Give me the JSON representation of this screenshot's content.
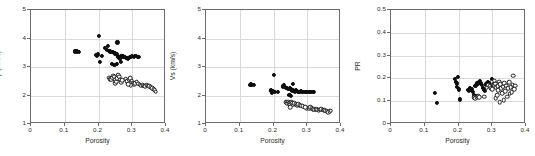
{
  "figure": {
    "background": "#ffffff",
    "grid": true,
    "marker_colors": {
      "filled": "#0d0d0d",
      "open_edge": "#1a1a1a",
      "open_fill": "#ffffff"
    }
  },
  "chart_data": [
    {
      "type": "scatter",
      "title": "",
      "xlabel": "Porosity",
      "ylabel": "Vp (Km/s)",
      "xlim": [
        0,
        0.4
      ],
      "ylim": [
        1,
        5
      ],
      "xticks": [
        0,
        0.1,
        0.2,
        0.3,
        0.4
      ],
      "xticklabels": [
        "0",
        "0.1",
        "0.2",
        "0.3",
        "0.4"
      ],
      "yticks": [
        1,
        2,
        3,
        4,
        5
      ],
      "yticklabels": [
        "1",
        "2",
        "3",
        "4",
        "5"
      ],
      "grid": true,
      "legend": "none",
      "series": [
        {
          "name": "filled-circles",
          "marker": "filled",
          "points": [
            [
              0.129,
              3.55
            ],
            [
              0.133,
              3.56
            ],
            [
              0.137,
              3.55
            ],
            [
              0.141,
              3.54
            ],
            [
              0.193,
              3.42
            ],
            [
              0.196,
              3.4
            ],
            [
              0.199,
              3.44
            ],
            [
              0.2,
              4.1
            ],
            [
              0.203,
              3.17
            ],
            [
              0.21,
              3.38
            ],
            [
              0.22,
              3.68
            ],
            [
              0.226,
              3.6
            ],
            [
              0.229,
              3.74
            ],
            [
              0.232,
              3.57
            ],
            [
              0.234,
              3.55
            ],
            [
              0.238,
              3.53
            ],
            [
              0.24,
              3.1
            ],
            [
              0.243,
              3.52
            ],
            [
              0.246,
              3.5
            ],
            [
              0.249,
              3.48
            ],
            [
              0.252,
              3.46
            ],
            [
              0.254,
              3.44
            ],
            [
              0.256,
              3.86
            ],
            [
              0.258,
              3.36
            ],
            [
              0.26,
              3.34
            ],
            [
              0.262,
              3.33
            ],
            [
              0.264,
              3.3
            ],
            [
              0.266,
              3.18
            ],
            [
              0.268,
              3.4
            ],
            [
              0.271,
              3.38
            ],
            [
              0.274,
              3.36
            ],
            [
              0.277,
              3.34
            ],
            [
              0.28,
              3.33
            ],
            [
              0.283,
              3.31
            ],
            [
              0.286,
              3.3
            ],
            [
              0.289,
              3.32
            ],
            [
              0.292,
              3.36
            ],
            [
              0.296,
              3.34
            ],
            [
              0.3,
              3.38
            ],
            [
              0.304,
              3.36
            ],
            [
              0.308,
              3.4
            ],
            [
              0.312,
              3.38
            ],
            [
              0.316,
              3.36
            ],
            [
              0.318,
              3.34
            ],
            [
              0.255,
              3.12
            ],
            [
              0.247,
              3.08
            ]
          ]
        },
        {
          "name": "open-circles",
          "marker": "open",
          "points": [
            [
              0.231,
              2.62
            ],
            [
              0.234,
              2.58
            ],
            [
              0.237,
              2.55
            ],
            [
              0.24,
              2.62
            ],
            [
              0.243,
              2.7
            ],
            [
              0.246,
              2.66
            ],
            [
              0.249,
              2.56
            ],
            [
              0.249,
              2.44
            ],
            [
              0.252,
              2.48
            ],
            [
              0.255,
              2.6
            ],
            [
              0.258,
              2.72
            ],
            [
              0.261,
              2.66
            ],
            [
              0.264,
              2.56
            ],
            [
              0.267,
              2.46
            ],
            [
              0.271,
              2.54
            ],
            [
              0.281,
              2.58
            ],
            [
              0.285,
              2.5
            ],
            [
              0.29,
              2.56
            ],
            [
              0.294,
              2.6
            ],
            [
              0.298,
              2.52
            ],
            [
              0.301,
              2.44
            ],
            [
              0.305,
              2.4
            ],
            [
              0.309,
              2.44
            ],
            [
              0.313,
              2.48
            ],
            [
              0.318,
              2.42
            ],
            [
              0.322,
              2.38
            ],
            [
              0.327,
              2.34
            ],
            [
              0.331,
              2.36
            ],
            [
              0.335,
              2.34
            ],
            [
              0.339,
              2.33
            ],
            [
              0.343,
              2.36
            ],
            [
              0.347,
              2.34
            ],
            [
              0.351,
              2.32
            ],
            [
              0.355,
              2.3
            ],
            [
              0.359,
              2.26
            ],
            [
              0.363,
              2.22
            ],
            [
              0.366,
              2.18
            ],
            [
              0.369,
              2.14
            ],
            [
              0.296,
              2.36
            ],
            [
              0.288,
              2.4
            ]
          ]
        }
      ]
    },
    {
      "type": "scatter",
      "title": "",
      "xlabel": "Porosity",
      "ylabel": "Vs (km/s)",
      "xlim": [
        0,
        0.4
      ],
      "ylim": [
        1,
        5
      ],
      "xticks": [
        0,
        0.1,
        0.2,
        0.3,
        0.4
      ],
      "xticklabels": [
        "0",
        "0.1",
        "0.2",
        "0.3",
        "0.4"
      ],
      "yticks": [
        1,
        2,
        3,
        4,
        5
      ],
      "yticklabels": [
        "1",
        "2",
        "3",
        "4",
        "5"
      ],
      "grid": true,
      "legend": "none",
      "series": [
        {
          "name": "filled-circles",
          "marker": "filled",
          "points": [
            [
              0.129,
              2.38
            ],
            [
              0.133,
              2.39
            ],
            [
              0.137,
              2.38
            ],
            [
              0.141,
              2.37
            ],
            [
              0.192,
              2.18
            ],
            [
              0.196,
              2.1
            ],
            [
              0.199,
              2.16
            ],
            [
              0.201,
              2.72
            ],
            [
              0.204,
              2.12
            ],
            [
              0.212,
              2.14
            ],
            [
              0.228,
              2.32
            ],
            [
              0.231,
              2.36
            ],
            [
              0.234,
              2.3
            ],
            [
              0.237,
              2.28
            ],
            [
              0.24,
              2.26
            ],
            [
              0.243,
              2.24
            ],
            [
              0.246,
              2.22
            ],
            [
              0.249,
              2.26
            ],
            [
              0.252,
              2.24
            ],
            [
              0.254,
              2.2
            ],
            [
              0.256,
              2.18
            ],
            [
              0.258,
              2.42
            ],
            [
              0.26,
              2.16
            ],
            [
              0.263,
              2.14
            ],
            [
              0.266,
              2.18
            ],
            [
              0.269,
              2.16
            ],
            [
              0.272,
              2.14
            ],
            [
              0.275,
              2.12
            ],
            [
              0.278,
              2.14
            ],
            [
              0.281,
              2.16
            ],
            [
              0.284,
              2.14
            ],
            [
              0.288,
              2.12
            ],
            [
              0.292,
              2.14
            ],
            [
              0.296,
              2.13
            ],
            [
              0.3,
              2.12
            ],
            [
              0.304,
              2.14
            ],
            [
              0.308,
              2.12
            ],
            [
              0.312,
              2.14
            ],
            [
              0.316,
              2.13
            ],
            [
              0.32,
              2.12
            ],
            [
              0.247,
              2.02
            ],
            [
              0.252,
              2.0
            ]
          ]
        },
        {
          "name": "open-circles",
          "marker": "open",
          "points": [
            [
              0.238,
              1.76
            ],
            [
              0.241,
              1.72
            ],
            [
              0.244,
              1.78
            ],
            [
              0.247,
              1.74
            ],
            [
              0.25,
              1.7
            ],
            [
              0.25,
              1.58
            ],
            [
              0.253,
              1.76
            ],
            [
              0.256,
              1.72
            ],
            [
              0.259,
              1.68
            ],
            [
              0.262,
              1.74
            ],
            [
              0.266,
              1.7
            ],
            [
              0.27,
              1.66
            ],
            [
              0.274,
              1.7
            ],
            [
              0.278,
              1.66
            ],
            [
              0.282,
              1.64
            ],
            [
              0.29,
              1.6
            ],
            [
              0.298,
              1.56
            ],
            [
              0.305,
              1.54
            ],
            [
              0.309,
              1.58
            ],
            [
              0.313,
              1.56
            ],
            [
              0.317,
              1.52
            ],
            [
              0.321,
              1.5
            ],
            [
              0.326,
              1.52
            ],
            [
              0.33,
              1.5
            ],
            [
              0.334,
              1.48
            ],
            [
              0.338,
              1.5
            ],
            [
              0.342,
              1.52
            ],
            [
              0.346,
              1.5
            ],
            [
              0.35,
              1.48
            ],
            [
              0.354,
              1.46
            ],
            [
              0.358,
              1.44
            ],
            [
              0.362,
              1.42
            ],
            [
              0.366,
              1.44
            ],
            [
              0.369,
              1.46
            ],
            [
              0.286,
              1.62
            ],
            [
              0.294,
              1.58
            ]
          ]
        }
      ]
    },
    {
      "type": "scatter",
      "title": "",
      "xlabel": "Porosity",
      "ylabel": "PR",
      "xlim": [
        0,
        0.4
      ],
      "ylim": [
        0,
        0.5
      ],
      "xticks": [
        0,
        0.1,
        0.2,
        0.3,
        0.4
      ],
      "xticklabels": [
        "0",
        "0.1",
        "0.2",
        "0.3",
        "0.4"
      ],
      "yticks": [
        0,
        0.1,
        0.2,
        0.3,
        0.4,
        0.5
      ],
      "yticklabels": [
        "0",
        "0.1",
        "0.2",
        "0.3",
        "0.4",
        "0.5"
      ],
      "grid": true,
      "legend": "none",
      "series": [
        {
          "name": "filled-circles",
          "marker": "filled",
          "points": [
            [
              0.131,
              0.138
            ],
            [
              0.137,
              0.094
            ],
            [
              0.19,
              0.197
            ],
            [
              0.193,
              0.186
            ],
            [
              0.196,
              0.178
            ],
            [
              0.196,
              0.162
            ],
            [
              0.199,
              0.205
            ],
            [
              0.202,
              0.152
            ],
            [
              0.205,
              0.108
            ],
            [
              0.228,
              0.148
            ],
            [
              0.231,
              0.144
            ],
            [
              0.234,
              0.158
            ],
            [
              0.238,
              0.152
            ],
            [
              0.242,
              0.14
            ],
            [
              0.246,
              0.128
            ],
            [
              0.25,
              0.166
            ],
            [
              0.252,
              0.172
            ],
            [
              0.255,
              0.18
            ],
            [
              0.258,
              0.176
            ],
            [
              0.261,
              0.184
            ],
            [
              0.264,
              0.188
            ],
            [
              0.267,
              0.178
            ],
            [
              0.27,
              0.17
            ],
            [
              0.273,
              0.16
            ],
            [
              0.276,
              0.152
            ],
            [
              0.279,
              0.146
            ],
            [
              0.282,
              0.174
            ],
            [
              0.285,
              0.182
            ],
            [
              0.288,
              0.186
            ],
            [
              0.291,
              0.178
            ],
            [
              0.294,
              0.17
            ],
            [
              0.297,
              0.162
            ],
            [
              0.3,
              0.196
            ],
            [
              0.304,
              0.178
            ],
            [
              0.252,
              0.122
            ],
            [
              0.245,
              0.116
            ]
          ]
        },
        {
          "name": "open-circles",
          "marker": "open",
          "points": [
            [
              0.246,
              0.118
            ],
            [
              0.25,
              0.112
            ],
            [
              0.254,
              0.116
            ],
            [
              0.258,
              0.122
            ],
            [
              0.262,
              0.118
            ],
            [
              0.288,
              0.17
            ],
            [
              0.292,
              0.166
            ],
            [
              0.296,
              0.158
            ],
            [
              0.3,
              0.152
            ],
            [
              0.304,
              0.172
            ],
            [
              0.308,
              0.176
            ],
            [
              0.31,
              0.112
            ],
            [
              0.312,
              0.16
            ],
            [
              0.314,
              0.126
            ],
            [
              0.316,
              0.166
            ],
            [
              0.318,
              0.148
            ],
            [
              0.32,
              0.186
            ],
            [
              0.322,
              0.096
            ],
            [
              0.324,
              0.174
            ],
            [
              0.327,
              0.158
            ],
            [
              0.33,
              0.136
            ],
            [
              0.332,
              0.164
            ],
            [
              0.334,
              0.104
            ],
            [
              0.336,
              0.178
            ],
            [
              0.338,
              0.144
            ],
            [
              0.341,
              0.168
            ],
            [
              0.344,
              0.12
            ],
            [
              0.347,
              0.156
            ],
            [
              0.35,
              0.184
            ],
            [
              0.352,
              0.132
            ],
            [
              0.355,
              0.162
            ],
            [
              0.358,
              0.14
            ],
            [
              0.36,
              0.172
            ],
            [
              0.362,
              0.212
            ],
            [
              0.365,
              0.152
            ],
            [
              0.368,
              0.168
            ],
            [
              0.305,
              0.19
            ],
            [
              0.298,
              0.186
            ],
            [
              0.283,
              0.16
            ],
            [
              0.276,
              0.12
            ]
          ]
        }
      ]
    }
  ]
}
